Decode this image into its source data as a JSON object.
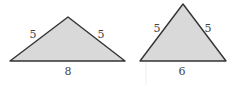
{
  "triangles": [
    {
      "name": "wide-isosceles",
      "sides": {
        "left": "5",
        "right": "5",
        "base": "8"
      },
      "vertices": [
        [
          10,
          61
        ],
        [
          68,
          17
        ],
        [
          125,
          61
        ]
      ]
    },
    {
      "name": "tall-isosceles",
      "sides": {
        "left": "5",
        "right": "5",
        "base": "6"
      },
      "vertices": [
        [
          140,
          61
        ],
        [
          183,
          4
        ],
        [
          226,
          61
        ]
      ]
    }
  ],
  "colors": {
    "fill": "#d9d9d9",
    "stroke": "#333333",
    "label": "#444444"
  }
}
